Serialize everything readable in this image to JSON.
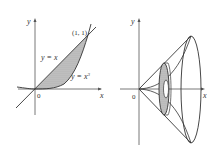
{
  "left_figure": {
    "y_axis_label": "y",
    "x_axis_label": "x",
    "origin_label": "0",
    "point_label": "(1, 1)",
    "line_label": "y = x",
    "curve_label": "y = x",
    "curve_exponent": "3",
    "region": "shaded region between y = x and y = x^3"
  },
  "right_figure": {
    "y_axis_label": "y",
    "x_axis_label": "x",
    "origin_label": "0",
    "description": "solid of revolution about x-axis with washer cross-section"
  },
  "colors": {
    "line": "#3a3a3a",
    "shade": "#b8b8b8",
    "background": "#ffffff"
  }
}
